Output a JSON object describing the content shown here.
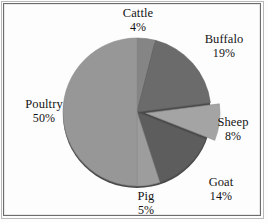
{
  "chart_data": {
    "type": "pie",
    "title": "",
    "subtitle": "",
    "xlabel": "",
    "ylabel": "",
    "grid": false,
    "legend_position": "none",
    "label_format": "name above percent",
    "start_angle_deg": 0,
    "direction": "clockwise",
    "exploded_slices": [
      "Sheep"
    ],
    "categories": [
      "Cattle",
      "Buffalo",
      "Sheep",
      "Goat",
      "Pig",
      "Poultry"
    ],
    "values": [
      4,
      19,
      8,
      14,
      5,
      50
    ],
    "unit": "%",
    "total": 100,
    "slices": [
      {
        "name": "Cattle",
        "value": 4,
        "percent_label": "4%",
        "color": "#858585",
        "exploded": false
      },
      {
        "name": "Buffalo",
        "value": 19,
        "percent_label": "19%",
        "color": "#6b6b6b",
        "exploded": false
      },
      {
        "name": "Sheep",
        "value": 8,
        "percent_label": "8%",
        "color": "#a4a4a4",
        "exploded": true
      },
      {
        "name": "Goat",
        "value": 14,
        "percent_label": "14%",
        "color": "#5d5d5d",
        "exploded": false
      },
      {
        "name": "Pig",
        "value": 5,
        "percent_label": "5%",
        "color": "#9d9d9d",
        "exploded": false
      },
      {
        "name": "Poultry",
        "value": 50,
        "percent_label": "50%",
        "color": "#979797",
        "exploded": false
      }
    ]
  },
  "labels": {
    "cattle": {
      "name": "Cattle",
      "value": "4%"
    },
    "buffalo": {
      "name": "Buffalo",
      "value": "19%"
    },
    "sheep": {
      "name": "Sheep",
      "value": "8%"
    },
    "goat": {
      "name": "Goat",
      "value": "14%"
    },
    "pig": {
      "name": "Pig",
      "value": "5%"
    },
    "poultry": {
      "name": "Poultry",
      "value": "50%"
    }
  },
  "colors": {
    "background": "#fdfdfd",
    "frame_border": "#6c6c6c",
    "text": "#141414",
    "pie_shadow": "#3a3a3a"
  }
}
